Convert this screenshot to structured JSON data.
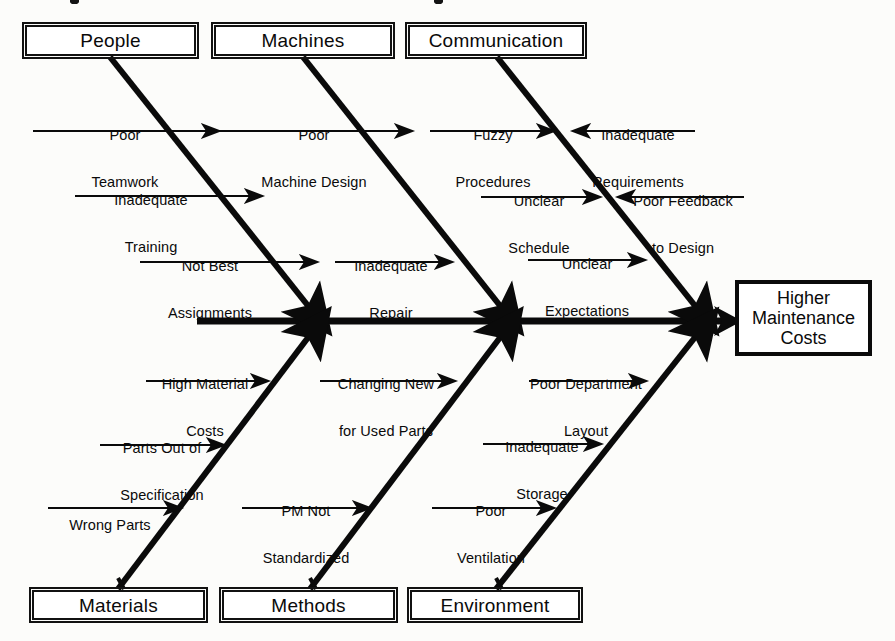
{
  "diagram": {
    "type": "fishbone-ishikawa",
    "effect": {
      "label": "Higher\nMaintenance\nCosts",
      "line1": "Higher",
      "line2": "Maintenance",
      "line3": "Costs"
    },
    "colors": {
      "ink": "#0a0a0a",
      "paper": "#fcfcfa",
      "box_border": "#111111"
    },
    "categories": [
      {
        "id": "people",
        "label": "People",
        "side": "top",
        "causes": [
          {
            "label": "Poor\nTeamwork",
            "line1": "Poor",
            "line2": "Teamwork",
            "direction": "right"
          },
          {
            "label": "Inadequate\nTraining",
            "line1": "Inadequate",
            "line2": "Training",
            "direction": "right"
          },
          {
            "label": "Not Best\nAssignments",
            "line1": "Not Best",
            "line2": "Assignments",
            "direction": "right"
          }
        ]
      },
      {
        "id": "machines",
        "label": "Machines",
        "side": "top",
        "causes": [
          {
            "label": "Poor\nMachine Design",
            "line1": "Poor",
            "line2": "Machine Design",
            "direction": "right"
          },
          {
            "label": "Inadequate\nRepair",
            "line1": "Inadequate",
            "line2": "Repair",
            "direction": "right"
          }
        ]
      },
      {
        "id": "communication",
        "label": "Communication",
        "side": "top",
        "causes": [
          {
            "label": "Fuzzy\nProcedures",
            "line1": "Fuzzy",
            "line2": "Procedures",
            "direction": "right"
          },
          {
            "label": "Inadequate\nRequirements",
            "line1": "Inadequate",
            "line2": "Requirements",
            "direction": "left"
          },
          {
            "label": "Unclear\nSchedule",
            "line1": "Unclear",
            "line2": "Schedule",
            "direction": "right"
          },
          {
            "label": "Poor Feedback\nto Design",
            "line1": "Poor Feedback",
            "line2": "to Design",
            "direction": "left"
          },
          {
            "label": "Unclear\nExpectations",
            "line1": "Unclear",
            "line2": "Expectations",
            "direction": "right"
          }
        ]
      },
      {
        "id": "materials",
        "label": "Materials",
        "side": "bottom",
        "causes": [
          {
            "label": "High Material\nCosts",
            "line1": "High Material",
            "line2": "Costs",
            "direction": "right"
          },
          {
            "label": "Parts Out of\nSpecification",
            "line1": "Parts Out of",
            "line2": "Specification",
            "direction": "right"
          },
          {
            "label": "Wrong Parts",
            "line1": "Wrong Parts",
            "line2": "",
            "direction": "right"
          }
        ]
      },
      {
        "id": "methods",
        "label": "Methods",
        "side": "bottom",
        "causes": [
          {
            "label": "Changing New\nfor Used Parts",
            "line1": "Changing New",
            "line2": "for Used Parts",
            "direction": "right"
          },
          {
            "label": "PM Not\nStandardized",
            "line1": "PM Not",
            "line2": "Standardized",
            "direction": "right"
          }
        ]
      },
      {
        "id": "environment",
        "label": "Environment",
        "side": "bottom",
        "causes": [
          {
            "label": "Poor Department\nLayout",
            "line1": "Poor Department",
            "line2": "Layout",
            "direction": "right"
          },
          {
            "label": "Inadequate\nStorage",
            "line1": "Inadequate",
            "line2": "Storage",
            "direction": "right"
          },
          {
            "label": "Poor\nVentilation",
            "line1": "Poor",
            "line2": "Ventilation",
            "direction": "right"
          }
        ]
      }
    ]
  }
}
